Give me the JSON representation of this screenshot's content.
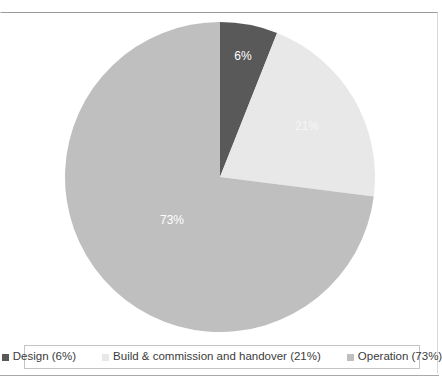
{
  "figure": {
    "background_color": "#ffffff",
    "frame_border_color": "#9b9b9b",
    "divider_color": "#a9a9a9"
  },
  "chart_data": {
    "type": "pie",
    "title": "",
    "subtitle": "",
    "xlabel": "",
    "ylabel": "",
    "grid": false,
    "legend_position": "bottom",
    "start_angle_clock": "12 o'clock",
    "direction": "clockwise",
    "categories": [
      "Design",
      "Build & commission and handover",
      "Operation"
    ],
    "values": [
      6,
      21,
      73
    ],
    "value_unit": "%",
    "data_labels": [
      "6%",
      "21%",
      "73%"
    ],
    "colors": [
      "#595959",
      "#e8e8e8",
      "#bfbfbf"
    ],
    "data_label_color": "#ffffff",
    "slices": [
      {
        "name": "Design",
        "value": 6,
        "label": "6%",
        "color": "#595959",
        "legend_label": "Design (6%)",
        "label_x": 178,
        "label_y": 35,
        "faint": false
      },
      {
        "name": "Build & commission and handover",
        "value": 21,
        "label": "21%",
        "color": "#e8e8e8",
        "legend_label": "Build & commission and handover (21%)",
        "label_x": 242,
        "label_y": 105,
        "faint": true
      },
      {
        "name": "Operation",
        "value": 73,
        "label": "73%",
        "color": "#bfbfbf",
        "legend_label": "Operation (73%)",
        "label_x": 107,
        "label_y": 199,
        "faint": false
      }
    ]
  },
  "legend": {
    "border_color": "#c4c4c4",
    "items": [
      {
        "marker": "square-marker-design",
        "color": "#595959",
        "label": "Design (6%)"
      },
      {
        "marker": "square-marker-build",
        "color": "#e8e8e8",
        "label": "Build & commission and handover (21%)"
      },
      {
        "marker": "square-marker-operation",
        "color": "#bfbfbf",
        "label": "Operation (73%)"
      }
    ]
  }
}
